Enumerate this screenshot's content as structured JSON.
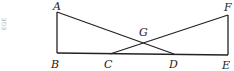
{
  "figure": {
    "type": "geometry",
    "stroke_color": "#222222",
    "side_text": "EGE",
    "points": {
      "A": {
        "label": "A",
        "x": 57,
        "y": 12
      },
      "B": {
        "label": "B",
        "x": 57,
        "y": 53
      },
      "C": {
        "label": "C",
        "x": 110,
        "y": 54
      },
      "D": {
        "label": "D",
        "x": 174,
        "y": 54
      },
      "E": {
        "label": "E",
        "x": 228,
        "y": 55
      },
      "F": {
        "label": "F",
        "x": 228,
        "y": 15
      },
      "G": {
        "label": "G",
        "x": 142,
        "y": 43
      }
    },
    "segments": [
      [
        "A",
        "B"
      ],
      [
        "B",
        "E"
      ],
      [
        "E",
        "F"
      ],
      [
        "A",
        "D"
      ],
      [
        "C",
        "F"
      ]
    ]
  }
}
